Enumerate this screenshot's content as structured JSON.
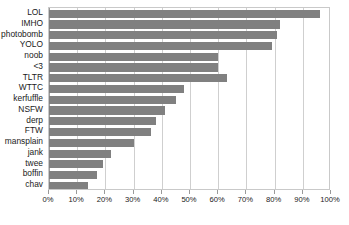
{
  "chart_data": {
    "type": "bar",
    "orientation": "horizontal",
    "title": "",
    "subtitle": "",
    "xlabel": "",
    "ylabel": "",
    "xlim": [
      0,
      100
    ],
    "xtick_step": 10,
    "grid": true,
    "legend": false,
    "bar_color": "#808080",
    "gridline_color": "#cfcfcf",
    "axis_color": "#9a9a9a",
    "background_color": "#ffffff",
    "tick_suffix": "%",
    "categories": [
      "LOL",
      "IMHO",
      "photobomb",
      "YOLO",
      "noob",
      "<3",
      "TLTR",
      "WTTC",
      "kerfuffle",
      "NSFW",
      "derp",
      "FTW",
      "mansplain",
      "jank",
      "twee",
      "boffin",
      "chav"
    ],
    "values": [
      96,
      82,
      81,
      79,
      60,
      60,
      63,
      48,
      45,
      41,
      38,
      36,
      30,
      22,
      19,
      17,
      14
    ],
    "xticks": [
      0,
      10,
      20,
      30,
      40,
      50,
      60,
      70,
      80,
      90,
      100
    ],
    "xticklabels": [
      "0%",
      "10%",
      "20%",
      "30%",
      "40%",
      "50%",
      "60%",
      "70%",
      "80%",
      "90%",
      "100%"
    ]
  }
}
